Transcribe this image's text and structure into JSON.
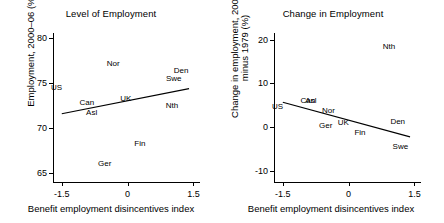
{
  "figure": {
    "panels": [
      {
        "id": "level-of-employment",
        "title": "Level of Employment",
        "xlabel": "Benefit employment disincentives index",
        "ylabel": "Employment, 2000–06 (%)"
      },
      {
        "id": "change-in-employment",
        "title": "Change in Employment",
        "xlabel": "Benefit employment disincentives index",
        "ylabel_line1": "Change in employment, 2000–06",
        "ylabel_line2": "minus 1979 (%)"
      }
    ]
  },
  "chart_data": [
    {
      "type": "scatter",
      "title": "Level of Employment",
      "xlabel": "Benefit employment disincentives index",
      "ylabel": "Employment, 2000–06 (%)",
      "xlim": [
        -1.7,
        1.65
      ],
      "ylim": [
        64.0,
        80.6
      ],
      "xticks": [
        -1.5,
        0,
        1.5
      ],
      "xticklabels": [
        "-1.5",
        "0",
        "1.5"
      ],
      "yticks": [
        65,
        70,
        75,
        80
      ],
      "yticklabels": [
        "65",
        "70",
        "75",
        "80"
      ],
      "grid": false,
      "legend": false,
      "labels_as_markers": true,
      "points": [
        {
          "label": "US",
          "x": -1.62,
          "y": 74.6
        },
        {
          "label": "Can",
          "x": -0.93,
          "y": 72.9
        },
        {
          "label": "Asl",
          "x": -0.82,
          "y": 71.8
        },
        {
          "label": "Ger",
          "x": -0.52,
          "y": 66.1
        },
        {
          "label": "Nor",
          "x": -0.33,
          "y": 77.3
        },
        {
          "label": "UK",
          "x": -0.04,
          "y": 73.4
        },
        {
          "label": "Fin",
          "x": 0.28,
          "y": 68.3
        },
        {
          "label": "Nth",
          "x": 1.01,
          "y": 72.6
        },
        {
          "label": "Swe",
          "x": 1.05,
          "y": 75.6
        },
        {
          "label": "Den",
          "x": 1.22,
          "y": 76.5
        }
      ],
      "fit_line": {
        "x0": -1.5,
        "y0": 71.6,
        "x1": 1.4,
        "y1": 74.4,
        "style": "solid"
      }
    },
    {
      "type": "scatter",
      "title": "Change in Employment",
      "xlabel": "Benefit employment disincentives index",
      "ylabel": "Change in employment, 2000–06 minus 1979 (%)",
      "xlim": [
        -1.7,
        1.65
      ],
      "ylim": [
        -12.5,
        21.5
      ],
      "xticks": [
        -1.5,
        0,
        1.5
      ],
      "xticklabels": [
        "-1.5",
        "0",
        "1.5"
      ],
      "yticks": [
        -10,
        0,
        10,
        20
      ],
      "yticklabels": [
        "-10",
        "0",
        "10",
        "20"
      ],
      "grid": false,
      "legend": false,
      "labels_as_markers": true,
      "points": [
        {
          "label": "US",
          "x": -1.62,
          "y": 4.9
        },
        {
          "label": "Can",
          "x": -0.93,
          "y": 6.2
        },
        {
          "label": "Asl",
          "x": -0.86,
          "y": 6.1
        },
        {
          "label": "Nor",
          "x": -0.46,
          "y": 3.9
        },
        {
          "label": "Ger",
          "x": -0.52,
          "y": 0.4
        },
        {
          "label": "UK",
          "x": -0.12,
          "y": 1.2
        },
        {
          "label": "Fin",
          "x": 0.26,
          "y": -1.0
        },
        {
          "label": "Nth",
          "x": 0.92,
          "y": 18.6
        },
        {
          "label": "Den",
          "x": 1.12,
          "y": 1.5
        },
        {
          "label": "Swe",
          "x": 1.18,
          "y": -4.3
        }
      ],
      "fit_line": {
        "x0": -1.5,
        "y0": 5.7,
        "x1": 1.4,
        "y1": -2.2,
        "style": "solid"
      }
    }
  ]
}
